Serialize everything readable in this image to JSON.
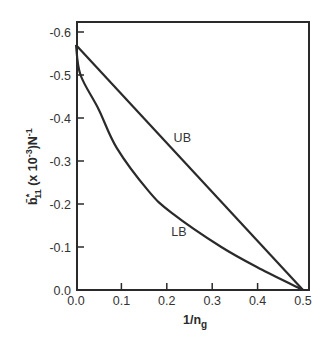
{
  "chart_data": {
    "type": "line",
    "title": "",
    "xlabel": "1/n_g",
    "xlabel_main": "1/n",
    "xlabel_sub": "g",
    "ylabel": "b̄*₁₁ (x 10⁻³) N⁻¹",
    "ylabel_parts": {
      "symbol": "b̄",
      "sup_star": "*",
      "sub": "11",
      "mid": " (x 10",
      "exp": "-3",
      "unit": ")N",
      "unit_exp": "-1"
    },
    "xlim": [
      0.0,
      0.5
    ],
    "ylim": [
      0.0,
      -0.6
    ],
    "y_axis_inverted": true,
    "grid": false,
    "legend": "none (inline curve labels)",
    "x_ticks": [
      "0.0",
      "0.1",
      "0.2",
      "0.3",
      "0.4",
      "0.5"
    ],
    "x_tick_values": [
      0.0,
      0.1,
      0.2,
      0.3,
      0.4,
      0.5
    ],
    "y_ticks": [
      "0.0",
      "-0.1",
      "-0.2",
      "-0.3",
      "-0.4",
      "-0.5",
      "-0.6"
    ],
    "y_tick_values": [
      0.0,
      -0.1,
      -0.2,
      -0.3,
      -0.4,
      -0.5,
      -0.6
    ],
    "series": [
      {
        "name": "UB",
        "label": "UB",
        "x": [
          0.0,
          0.5
        ],
        "values": [
          -0.57,
          0.0
        ],
        "label_pos": [
          0.215,
          -0.355
        ]
      },
      {
        "name": "LB",
        "label": "LB",
        "x": [
          0.0,
          0.01,
          0.05,
          0.09,
          0.16,
          0.21,
          0.32,
          0.41,
          0.5
        ],
        "values": [
          -0.57,
          -0.5,
          -0.42,
          -0.33,
          -0.23,
          -0.18,
          -0.1,
          -0.047,
          0.0
        ],
        "label_pos": [
          0.21,
          -0.137
        ]
      }
    ]
  }
}
